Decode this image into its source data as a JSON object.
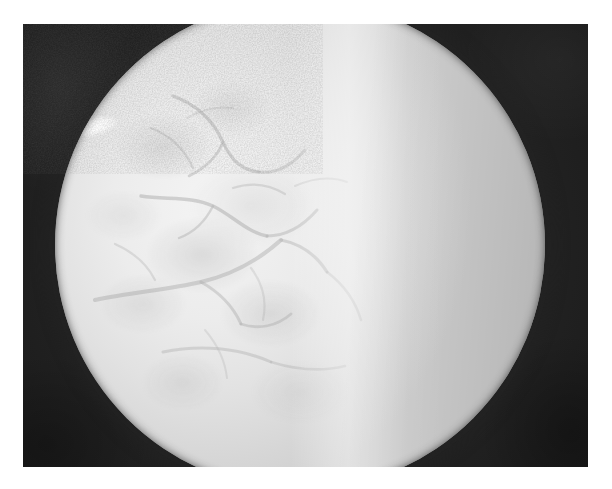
{
  "document": {
    "kind": "photograph",
    "modality": "grayscale circular-aperture photograph",
    "caption": "",
    "canvas": {
      "width": 612,
      "height": 489,
      "background": "#ffffff"
    }
  },
  "photo": {
    "frame": {
      "x": 23,
      "y": 24,
      "width": 565,
      "height": 443
    },
    "surround_color": "#262626",
    "aperture": {
      "shape": "circle",
      "center_x": 300,
      "center_y": 245,
      "radius": 245,
      "cropped_edges": "top-and-bottom"
    },
    "regions": [
      {
        "name": "left-lobe",
        "description": "mottled brighter tissue with branching vessel pattern",
        "mean_tone": "#ececec"
      },
      {
        "name": "bright-band",
        "description": "vertical bright ridge separating the two lobes",
        "mean_tone": "#f8f8f8"
      },
      {
        "name": "right-lobe",
        "description": "smooth gradient tissue darkening toward the right rim",
        "mean_tone": "#d2d2d2"
      }
    ],
    "features": [
      {
        "name": "specular-highlight",
        "x": 95,
        "y": 126,
        "tone": "#ffffff"
      },
      {
        "name": "vessel-network",
        "location": "left and lower-left quadrant",
        "tone": "#8d8d8d"
      }
    ],
    "palette": {
      "white": "#ffffff",
      "highlight": "#f9f9f9",
      "midtone": "#d8d8d8",
      "vessel": "#8d8d8d",
      "surround": "#262626",
      "deep_shadow": "#1b1b1b"
    },
    "grain": {
      "present": true,
      "intensity": "moderate"
    }
  },
  "annotations": {
    "labels": [],
    "scale_bar": null,
    "text_overlay": null
  }
}
